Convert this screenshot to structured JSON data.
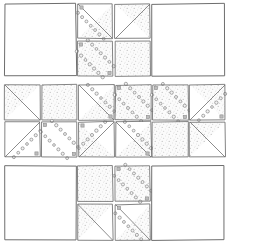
{
  "document": {
    "title": "Quilt block layout diagram",
    "kind": "hand-drawn patchwork / quilt piecing diagram",
    "background_color": "#ffffff",
    "ink_color": "#6e6e6e",
    "stipple_color": "#b9b9b9",
    "bead_color": "#8c8c8c",
    "canvas": {
      "width": 258,
      "height": 252
    }
  },
  "legend": {
    "fabrics": [
      {
        "id": "plain",
        "label": "plain / white fabric",
        "color": "#ffffff"
      },
      {
        "id": "stipple",
        "label": "speckled / dotted fabric",
        "color": "#eeeeee"
      },
      {
        "id": "bead",
        "label": "circle-print fabric",
        "color": "#e6e6e6"
      }
    ],
    "unit_types": [
      {
        "id": "whole",
        "label": "whole square"
      },
      {
        "id": "half-square",
        "label": "half-square triangle"
      }
    ]
  },
  "bands": [
    {
      "name": "top-band",
      "y": 4,
      "height": 72,
      "blocks": [
        {
          "name": "large-plain-square-top-left",
          "type": "whole",
          "fill": "plain",
          "x": 5,
          "y": 4,
          "w": 71,
          "h": 72
        },
        {
          "name": "four-patch-top-centre",
          "type": "four-patch",
          "x": 78,
          "y": 4,
          "w": 72,
          "h": 72,
          "cells": [
            {
              "name": "hst-beads-upper-left",
              "type": "half-square",
              "fill_a": "plain",
              "fill_b": "stipple",
              "diagonal": "tl-br",
              "beads": true,
              "bead_band": "above"
            },
            {
              "name": "hst-plain-upper-right",
              "type": "half-square",
              "fill_a": "plain",
              "fill_b": "stipple",
              "diagonal": "bl-tr",
              "beads": false,
              "bead_band": "none"
            },
            {
              "name": "beads-full-lower-left",
              "type": "whole",
              "fill_a": "stipple",
              "fill_b": "stipple",
              "diagonal": "none",
              "beads": true,
              "bead_band": "double"
            },
            {
              "name": "stipple-lower-right",
              "type": "whole",
              "fill_a": "stipple",
              "fill_b": "stipple",
              "diagonal": "none",
              "beads": false,
              "bead_band": "none"
            }
          ]
        },
        {
          "name": "large-plain-square-top-right",
          "type": "whole",
          "fill": "plain",
          "x": 152,
          "y": 4,
          "w": 72,
          "h": 72
        }
      ]
    },
    {
      "name": "middle-band-row-1",
      "y": 85,
      "height": 35,
      "blocks": [
        {
          "name": "hst-plain-stipple-m1c1",
          "type": "half-square",
          "fill_a": "stipple",
          "fill_b": "plain",
          "diagonal": "tl-br",
          "beads": false,
          "x": 5,
          "y": 85,
          "w": 35,
          "h": 35
        },
        {
          "name": "stipple-square-m1c2",
          "type": "whole",
          "fill_a": "stipple",
          "fill_b": "stipple",
          "diagonal": "none",
          "beads": false,
          "x": 42,
          "y": 85,
          "w": 35,
          "h": 35
        },
        {
          "name": "hst-beads-m1c3",
          "type": "half-square",
          "fill_a": "plain",
          "fill_b": "stipple",
          "diagonal": "tl-br",
          "beads": true,
          "bead_band": "below",
          "x": 79,
          "y": 85,
          "w": 35,
          "h": 35
        },
        {
          "name": "beads-double-m1c4",
          "type": "whole",
          "fill_a": "stipple",
          "fill_b": "stipple",
          "diagonal": "none",
          "beads": true,
          "bead_band": "double",
          "x": 116,
          "y": 85,
          "w": 35,
          "h": 35
        },
        {
          "name": "beads-double-m1c5",
          "type": "whole",
          "fill_a": "stipple",
          "fill_b": "stipple",
          "diagonal": "none",
          "beads": true,
          "bead_band": "double",
          "x": 153,
          "y": 85,
          "w": 35,
          "h": 35
        },
        {
          "name": "hst-beads-m1c6",
          "type": "half-square",
          "fill_a": "plain",
          "fill_b": "stipple",
          "diagonal": "bl-tr",
          "beads": true,
          "bead_band": "below",
          "x": 190,
          "y": 85,
          "w": 35,
          "h": 35
        }
      ]
    },
    {
      "name": "middle-band-row-2",
      "y": 122,
      "height": 35,
      "blocks": [
        {
          "name": "hst-beads-m2c1",
          "type": "half-square",
          "fill_a": "plain",
          "fill_b": "plain",
          "diagonal": "bl-tr",
          "beads": true,
          "bead_band": "below",
          "x": 5,
          "y": 122,
          "w": 35,
          "h": 35
        },
        {
          "name": "beads-double-m2c2",
          "type": "whole",
          "fill_a": "plain",
          "fill_b": "plain",
          "diagonal": "none",
          "beads": true,
          "bead_band": "double",
          "x": 42,
          "y": 122,
          "w": 35,
          "h": 35
        },
        {
          "name": "hst-beads-m2c3",
          "type": "half-square",
          "fill_a": "stipple",
          "fill_b": "plain",
          "diagonal": "bl-tr",
          "beads": true,
          "bead_band": "above",
          "x": 79,
          "y": 122,
          "w": 35,
          "h": 35
        },
        {
          "name": "hst-beads-m2c4",
          "type": "half-square",
          "fill_a": "plain",
          "fill_b": "stipple",
          "diagonal": "tl-br",
          "beads": true,
          "bead_band": "below",
          "x": 116,
          "y": 122,
          "w": 35,
          "h": 35
        },
        {
          "name": "stipple-square-m2c5",
          "type": "whole",
          "fill_a": "stipple",
          "fill_b": "stipple",
          "diagonal": "none",
          "beads": false,
          "x": 153,
          "y": 122,
          "w": 35,
          "h": 35
        },
        {
          "name": "hst-plain-stipple-m2c6",
          "type": "half-square",
          "fill_a": "stipple",
          "fill_b": "plain",
          "diagonal": "tl-br",
          "beads": false,
          "x": 190,
          "y": 122,
          "w": 35,
          "h": 35
        }
      ]
    },
    {
      "name": "bottom-band",
      "y": 166,
      "height": 74,
      "blocks": [
        {
          "name": "large-plain-square-bottom-left",
          "type": "whole",
          "fill": "plain",
          "x": 5,
          "y": 166,
          "w": 71,
          "h": 74
        },
        {
          "name": "four-patch-bottom-centre",
          "type": "four-patch",
          "x": 78,
          "y": 166,
          "w": 72,
          "h": 74,
          "cells": [
            {
              "name": "stipple-upper-left",
              "type": "whole",
              "fill_a": "stipple",
              "fill_b": "stipple",
              "diagonal": "none",
              "beads": false,
              "bead_band": "none"
            },
            {
              "name": "beads-double-upper-right",
              "type": "whole",
              "fill_a": "stipple",
              "fill_b": "stipple",
              "diagonal": "none",
              "beads": true,
              "bead_band": "double"
            },
            {
              "name": "hst-plain-lower-left",
              "type": "half-square",
              "fill_a": "stipple",
              "fill_b": "plain",
              "diagonal": "tl-br",
              "beads": false,
              "bead_band": "none"
            },
            {
              "name": "hst-beads-lower-right",
              "type": "half-square",
              "fill_a": "plain",
              "fill_b": "stipple",
              "diagonal": "tl-br",
              "beads": true,
              "bead_band": "above"
            }
          ]
        },
        {
          "name": "large-plain-square-bottom-right",
          "type": "whole",
          "fill": "plain",
          "x": 152,
          "y": 166,
          "w": 72,
          "h": 74
        }
      ]
    }
  ],
  "counts": {
    "large_plain_squares": 4,
    "small_units": 20,
    "bands": 4
  }
}
